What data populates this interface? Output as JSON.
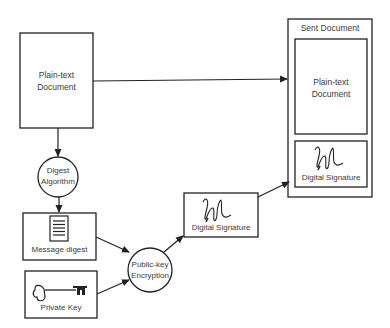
{
  "nodes": {
    "plaintext_source": {
      "label_line1": "Plain-text",
      "label_line2": "Document"
    },
    "digest_algorithm": {
      "label_line1": "Digest",
      "label_line2": "Algorithm"
    },
    "message_digest": {
      "label": "Message digest",
      "icon": "document-lines-icon"
    },
    "private_key": {
      "label": "Private Key",
      "icon": "key-icon"
    },
    "public_key_encryption": {
      "label_line1": "Public-key",
      "label_line2": "Encryption"
    },
    "digital_signature": {
      "label": "Digital Signature",
      "icon": "signature-icon"
    },
    "sent_document": {
      "title": "Sent Document",
      "plaintext": {
        "label_line1": "Plain-text",
        "label_line2": "Document"
      },
      "signature": {
        "label": "Digital Signature",
        "icon": "signature-icon"
      }
    }
  },
  "edges": [
    {
      "from": "plaintext_source",
      "to": "sent_document.plaintext"
    },
    {
      "from": "plaintext_source",
      "to": "digest_algorithm"
    },
    {
      "from": "digest_algorithm",
      "to": "message_digest"
    },
    {
      "from": "message_digest",
      "to": "public_key_encryption"
    },
    {
      "from": "private_key",
      "to": "public_key_encryption"
    },
    {
      "from": "public_key_encryption",
      "to": "digital_signature"
    },
    {
      "from": "digital_signature",
      "to": "sent_document.signature"
    }
  ],
  "colors": {
    "stroke": "#222222",
    "text": "#3a3a3a",
    "background": "#ffffff"
  }
}
